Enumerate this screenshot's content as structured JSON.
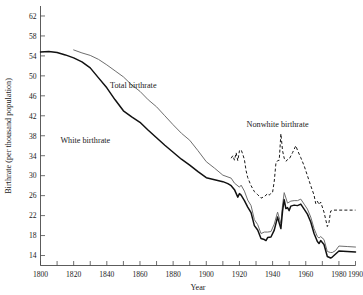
{
  "chart_data": {
    "type": "line",
    "title": "",
    "xlabel": "Year",
    "ylabel": "Birthrate (per thousand population)",
    "xlim": [
      1800,
      1990
    ],
    "ylim": [
      12,
      64
    ],
    "grid": false,
    "legend_position": "inline-annotations",
    "x_ticks_major": [
      1800,
      1820,
      1840,
      1860,
      1880,
      1900,
      1920,
      1940,
      1960,
      1980,
      1990
    ],
    "x_ticks_minor": [
      1810,
      1830,
      1850,
      1870,
      1890,
      1910,
      1930,
      1950,
      1970
    ],
    "y_ticks": [
      14,
      18,
      22,
      26,
      30,
      34,
      38,
      42,
      46,
      50,
      54,
      58,
      62
    ],
    "annotations": [
      {
        "text": "Total birthrate",
        "x": 1856,
        "y": 47.5
      },
      {
        "text": "White birthrate",
        "x": 1827,
        "y": 36.5
      },
      {
        "text": "Nonwhite birthrate",
        "x": 1943,
        "y": 39.8
      }
    ],
    "series": [
      {
        "name": "Total birthrate",
        "style": "solid-thin-gray",
        "color": "#6e6e6e",
        "points": [
          [
            1820,
            55.2
          ],
          [
            1825,
            54.6
          ],
          [
            1830,
            54.1
          ],
          [
            1835,
            53.3
          ],
          [
            1840,
            52.2
          ],
          [
            1845,
            51.0
          ],
          [
            1850,
            49.8
          ],
          [
            1855,
            48.2
          ],
          [
            1860,
            46.9
          ],
          [
            1865,
            45.2
          ],
          [
            1870,
            43.8
          ],
          [
            1875,
            42.0
          ],
          [
            1880,
            40.2
          ],
          [
            1885,
            38.5
          ],
          [
            1890,
            37.1
          ],
          [
            1895,
            35.0
          ],
          [
            1900,
            32.8
          ],
          [
            1905,
            31.5
          ],
          [
            1910,
            30.1
          ],
          [
            1915,
            29.5
          ],
          [
            1917,
            28.5
          ],
          [
            1920,
            27.7
          ],
          [
            1921,
            28.1
          ],
          [
            1923,
            26.9
          ],
          [
            1925,
            25.1
          ],
          [
            1927,
            24.0
          ],
          [
            1929,
            21.2
          ],
          [
            1931,
            20.2
          ],
          [
            1933,
            18.4
          ],
          [
            1935,
            18.7
          ],
          [
            1937,
            18.7
          ],
          [
            1939,
            18.8
          ],
          [
            1941,
            20.3
          ],
          [
            1943,
            22.7
          ],
          [
            1945,
            20.4
          ],
          [
            1946,
            24.1
          ],
          [
            1947,
            26.6
          ],
          [
            1949,
            24.5
          ],
          [
            1951,
            24.9
          ],
          [
            1953,
            25.0
          ],
          [
            1955,
            25.0
          ],
          [
            1957,
            25.3
          ],
          [
            1959,
            24.3
          ],
          [
            1961,
            23.3
          ],
          [
            1963,
            21.7
          ],
          [
            1965,
            19.4
          ],
          [
            1967,
            17.8
          ],
          [
            1968,
            17.5
          ],
          [
            1969,
            17.8
          ],
          [
            1971,
            17.2
          ],
          [
            1973,
            14.8
          ],
          [
            1975,
            14.6
          ],
          [
            1976,
            14.6
          ],
          [
            1978,
            15.0
          ],
          [
            1980,
            15.9
          ],
          [
            1985,
            15.8
          ],
          [
            1990,
            15.7
          ]
        ]
      },
      {
        "name": "White birthrate",
        "style": "solid-thick-black",
        "color": "#111111",
        "points": [
          [
            1800,
            54.8
          ],
          [
            1805,
            54.9
          ],
          [
            1810,
            54.7
          ],
          [
            1815,
            54.2
          ],
          [
            1820,
            53.6
          ],
          [
            1825,
            52.8
          ],
          [
            1830,
            51.6
          ],
          [
            1835,
            49.6
          ],
          [
            1840,
            47.6
          ],
          [
            1845,
            45.2
          ],
          [
            1850,
            43.0
          ],
          [
            1855,
            41.8
          ],
          [
            1860,
            40.7
          ],
          [
            1865,
            39.1
          ],
          [
            1870,
            37.6
          ],
          [
            1875,
            36.1
          ],
          [
            1880,
            34.7
          ],
          [
            1885,
            33.3
          ],
          [
            1890,
            32.1
          ],
          [
            1895,
            30.8
          ],
          [
            1900,
            29.6
          ],
          [
            1905,
            29.2
          ],
          [
            1910,
            28.8
          ],
          [
            1913,
            28.4
          ],
          [
            1915,
            28.0
          ],
          [
            1917,
            27.2
          ],
          [
            1919,
            25.7
          ],
          [
            1920,
            26.4
          ],
          [
            1921,
            26.1
          ],
          [
            1923,
            25.0
          ],
          [
            1925,
            23.7
          ],
          [
            1927,
            22.6
          ],
          [
            1929,
            20.0
          ],
          [
            1931,
            19.1
          ],
          [
            1933,
            17.4
          ],
          [
            1935,
            17.2
          ],
          [
            1936,
            17.0
          ],
          [
            1937,
            17.6
          ],
          [
            1939,
            17.7
          ],
          [
            1941,
            19.1
          ],
          [
            1943,
            21.7
          ],
          [
            1944,
            20.5
          ],
          [
            1945,
            19.4
          ],
          [
            1946,
            22.9
          ],
          [
            1947,
            25.2
          ],
          [
            1948,
            23.4
          ],
          [
            1949,
            23.6
          ],
          [
            1950,
            23.0
          ],
          [
            1951,
            23.9
          ],
          [
            1953,
            24.1
          ],
          [
            1955,
            24.0
          ],
          [
            1957,
            24.3
          ],
          [
            1959,
            23.3
          ],
          [
            1961,
            22.3
          ],
          [
            1963,
            20.7
          ],
          [
            1965,
            18.4
          ],
          [
            1967,
            16.8
          ],
          [
            1968,
            16.4
          ],
          [
            1969,
            17.0
          ],
          [
            1971,
            16.2
          ],
          [
            1973,
            13.8
          ],
          [
            1975,
            13.5
          ],
          [
            1976,
            13.7
          ],
          [
            1978,
            14.3
          ],
          [
            1980,
            14.9
          ],
          [
            1985,
            14.8
          ],
          [
            1990,
            14.7
          ]
        ]
      },
      {
        "name": "Nonwhite birthrate",
        "style": "dashed-black",
        "color": "#1a1a1a",
        "points": [
          [
            1915,
            33.5
          ],
          [
            1916,
            34.0
          ],
          [
            1917,
            33.1
          ],
          [
            1918,
            34.6
          ],
          [
            1919,
            33.0
          ],
          [
            1920,
            35.0
          ],
          [
            1921,
            35.2
          ],
          [
            1922,
            34.3
          ],
          [
            1923,
            33.2
          ],
          [
            1924,
            31.0
          ],
          [
            1925,
            29.6
          ],
          [
            1927,
            28.0
          ],
          [
            1929,
            26.8
          ],
          [
            1931,
            26.2
          ],
          [
            1933,
            25.5
          ],
          [
            1935,
            25.8
          ],
          [
            1936,
            26.1
          ],
          [
            1937,
            26.4
          ],
          [
            1938,
            26.1
          ],
          [
            1939,
            26.5
          ],
          [
            1940,
            26.7
          ],
          [
            1941,
            28.9
          ],
          [
            1942,
            32.5
          ],
          [
            1943,
            33.0
          ],
          [
            1944,
            33.1
          ],
          [
            1945,
            38.4
          ],
          [
            1946,
            35.0
          ],
          [
            1947,
            33.5
          ],
          [
            1948,
            32.9
          ],
          [
            1949,
            33.2
          ],
          [
            1950,
            33.3
          ],
          [
            1952,
            34.6
          ],
          [
            1953,
            35.3
          ],
          [
            1954,
            36.0
          ],
          [
            1955,
            35.1
          ],
          [
            1957,
            33.6
          ],
          [
            1959,
            32.0
          ],
          [
            1961,
            30.0
          ],
          [
            1963,
            28.0
          ],
          [
            1965,
            26.1
          ],
          [
            1966,
            24.4
          ],
          [
            1967,
            24.9
          ],
          [
            1968,
            24.2
          ],
          [
            1969,
            24.7
          ],
          [
            1971,
            22.7
          ],
          [
            1973,
            19.8
          ],
          [
            1974,
            20.6
          ],
          [
            1975,
            22.9
          ],
          [
            1977,
            23.1
          ],
          [
            1980,
            23.1
          ],
          [
            1985,
            23.1
          ],
          [
            1990,
            23.1
          ]
        ]
      }
    ]
  },
  "axes": {
    "y_label": "Birthrate (per thousand population)",
    "x_label": "Year",
    "y_tick_labels": [
      "62",
      "58",
      "54",
      "50",
      "46",
      "42",
      "38",
      "34",
      "30",
      "26",
      "22",
      "18",
      "14"
    ],
    "x_tick_labels": [
      "1800",
      "1820",
      "1840",
      "1860",
      "1880",
      "1900",
      "1920",
      "1940",
      "1960",
      "1980",
      "1990"
    ]
  },
  "annotations": {
    "total": "Total birthrate",
    "white": "White birthrate",
    "nonwhite": "Nonwhite birthrate"
  },
  "colors": {
    "total": "#6e6e6e",
    "white": "#111111",
    "nonwhite": "#1a1a1a",
    "axis": "#4a4a4a",
    "background": "#ffffff"
  }
}
